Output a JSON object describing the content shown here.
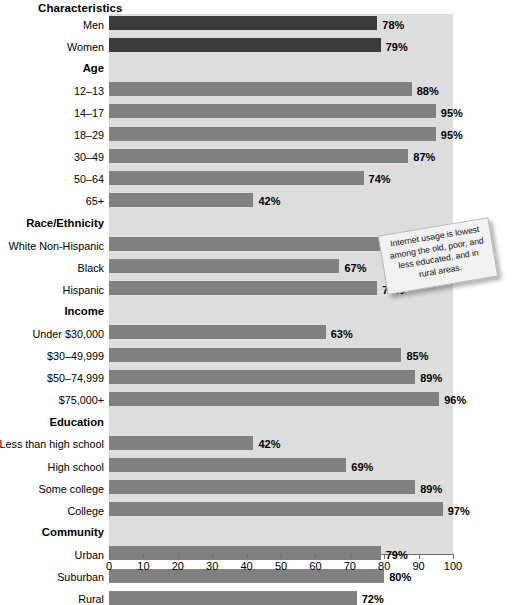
{
  "header": {
    "title": "Characteristics"
  },
  "annotation": {
    "name": "callout-note",
    "text": "Internet usage is lowest among the old, poor, and less educated, and in rural areas."
  },
  "chart_data": {
    "type": "bar",
    "orientation": "horizontal",
    "title": "Characteristics",
    "xlabel": "",
    "ylabel": "",
    "xlim": [
      0,
      100
    ],
    "xticks": [
      0,
      10,
      20,
      30,
      40,
      50,
      60,
      70,
      80,
      90,
      100
    ],
    "grid": false,
    "legend": "none",
    "value_suffix": "%",
    "colors": {
      "primary_bar": "#808080",
      "highlight_bar": "#3b3b3b",
      "plot_background": "#dddddd",
      "axis": "#6e6e6e"
    },
    "groups": [
      {
        "name": "Sex",
        "heading": "",
        "rows": [
          {
            "label": "Men",
            "value": 78,
            "display": "78%",
            "style": "dark"
          },
          {
            "label": "Women",
            "value": 79,
            "display": "79%",
            "style": "dark"
          }
        ]
      },
      {
        "name": "Age",
        "heading": "Age",
        "rows": [
          {
            "label": "12–13",
            "value": 88,
            "display": "88%",
            "style": "normal"
          },
          {
            "label": "14–17",
            "value": 95,
            "display": "95%",
            "style": "normal"
          },
          {
            "label": "18–29",
            "value": 95,
            "display": "95%",
            "style": "normal"
          },
          {
            "label": "30–49",
            "value": 87,
            "display": "87%",
            "style": "normal"
          },
          {
            "label": "50–64",
            "value": 74,
            "display": "74%",
            "style": "normal"
          },
          {
            "label": "65+",
            "value": 42,
            "display": "42%",
            "style": "normal"
          }
        ]
      },
      {
        "name": "Race/Ethnicity",
        "heading": "Race/Ethnicity",
        "rows": [
          {
            "label": "White Non-Hispanic",
            "value": 79,
            "display": "79%",
            "style": "normal"
          },
          {
            "label": "Black",
            "value": 67,
            "display": "67%",
            "style": "normal"
          },
          {
            "label": "Hispanic",
            "value": 78,
            "display": "78%",
            "style": "normal"
          }
        ]
      },
      {
        "name": "Income",
        "heading": "Income",
        "rows": [
          {
            "label": "Under $30,000",
            "value": 63,
            "display": "63%",
            "style": "normal"
          },
          {
            "label": "$30–49,999",
            "value": 85,
            "display": "85%",
            "style": "normal"
          },
          {
            "label": "$50–74,999",
            "value": 89,
            "display": "89%",
            "style": "normal"
          },
          {
            "label": "$75,000+",
            "value": 96,
            "display": "96%",
            "style": "normal"
          }
        ]
      },
      {
        "name": "Education",
        "heading": "Education",
        "rows": [
          {
            "label": "Less than high school",
            "value": 42,
            "display": "42%",
            "style": "normal"
          },
          {
            "label": "High school",
            "value": 69,
            "display": "69%",
            "style": "normal"
          },
          {
            "label": "Some college",
            "value": 89,
            "display": "89%",
            "style": "normal"
          },
          {
            "label": "College",
            "value": 97,
            "display": "97%",
            "style": "normal"
          }
        ]
      },
      {
        "name": "Community",
        "heading": "Community",
        "rows": [
          {
            "label": "Urban",
            "value": 79,
            "display": "79%",
            "style": "normal"
          },
          {
            "label": "Suburban",
            "value": 80,
            "display": "80%",
            "style": "normal"
          },
          {
            "label": "Rural",
            "value": 72,
            "display": "72%",
            "style": "normal"
          }
        ]
      }
    ]
  }
}
